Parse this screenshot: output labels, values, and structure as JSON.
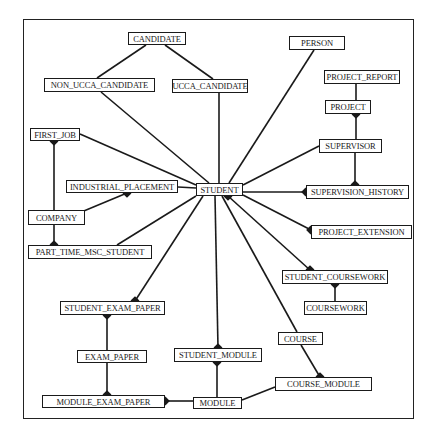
{
  "diagram": {
    "type": "entity-relationship",
    "entities": [
      {
        "id": "candidate",
        "label": "CANDIDATE",
        "x": 128,
        "y": 32,
        "w": 58,
        "h": 13
      },
      {
        "id": "non_ucca_candidate",
        "label": "NON_UCCA_CANDIDATE",
        "x": 44,
        "y": 78,
        "w": 111,
        "h": 14
      },
      {
        "id": "ucca_candidate",
        "label": "UCCA_CANDIDATE",
        "x": 172,
        "y": 79,
        "w": 76,
        "h": 14
      },
      {
        "id": "person",
        "label": "PERSON",
        "x": 289,
        "y": 36,
        "w": 56,
        "h": 14
      },
      {
        "id": "project_report",
        "label": "PROJECT_REPORT",
        "x": 324,
        "y": 70,
        "w": 76,
        "h": 14
      },
      {
        "id": "project",
        "label": "PROJECT",
        "x": 325,
        "y": 100,
        "w": 46,
        "h": 14
      },
      {
        "id": "supervisor",
        "label": "SUPERVISOR",
        "x": 319,
        "y": 139,
        "w": 63,
        "h": 14
      },
      {
        "id": "first_job",
        "label": "FIRST_JOB",
        "x": 30,
        "y": 128,
        "w": 50,
        "h": 13
      },
      {
        "id": "industrial_placement",
        "label": "INDUSTRIAL_PLACEMENT",
        "x": 66,
        "y": 180,
        "w": 112,
        "h": 13
      },
      {
        "id": "student",
        "label": "STUDENT",
        "x": 196,
        "y": 183,
        "w": 47,
        "h": 13
      },
      {
        "id": "supervision_history",
        "label": "SUPERVISION_HISTORY",
        "x": 306,
        "y": 185,
        "w": 103,
        "h": 14
      },
      {
        "id": "company",
        "label": "COMPANY",
        "x": 28,
        "y": 210,
        "w": 57,
        "h": 15
      },
      {
        "id": "project_extension",
        "label": "PROJECT_EXTENSION",
        "x": 311,
        "y": 225,
        "w": 101,
        "h": 14
      },
      {
        "id": "part_time_msc_student",
        "label": "PART_TIME_MSC_STUDENT",
        "x": 28,
        "y": 245,
        "w": 124,
        "h": 14
      },
      {
        "id": "student_coursework",
        "label": "STUDENT_COURSEWORK",
        "x": 282,
        "y": 270,
        "w": 106,
        "h": 14
      },
      {
        "id": "coursework",
        "label": "COURSEWORK",
        "x": 304,
        "y": 301,
        "w": 63,
        "h": 14
      },
      {
        "id": "student_exam_paper",
        "label": "STUDENT_EXAM_PAPER",
        "x": 60,
        "y": 301,
        "w": 105,
        "h": 14
      },
      {
        "id": "course",
        "label": "COURSE",
        "x": 278,
        "y": 332,
        "w": 45,
        "h": 13
      },
      {
        "id": "exam_paper",
        "label": "EXAM_PAPER",
        "x": 77,
        "y": 350,
        "w": 70,
        "h": 13
      },
      {
        "id": "student_module",
        "label": "STUDENT_MODULE",
        "x": 174,
        "y": 348,
        "w": 88,
        "h": 14
      },
      {
        "id": "course_module",
        "label": "COURSE_MODULE",
        "x": 275,
        "y": 377,
        "w": 97,
        "h": 14
      },
      {
        "id": "module_exam_paper",
        "label": "MODULE_EXAM_PAPER",
        "x": 42,
        "y": 395,
        "w": 123,
        "h": 13
      },
      {
        "id": "module",
        "label": "MODULE",
        "x": 193,
        "y": 397,
        "w": 49,
        "h": 12
      }
    ],
    "relationships": [
      {
        "from": "candidate",
        "to": "non_ucca_candidate",
        "x1": 146,
        "y1": 45,
        "x2": 97,
        "y2": 78
      },
      {
        "from": "candidate",
        "to": "ucca_candidate",
        "x1": 165,
        "y1": 45,
        "x2": 213,
        "y2": 79
      },
      {
        "from": "non_ucca_candidate",
        "to": "student",
        "x1": 101,
        "y1": 92,
        "x2": 209,
        "y2": 183
      },
      {
        "from": "ucca_candidate",
        "to": "student",
        "x1": 219,
        "y1": 93,
        "x2": 219,
        "y2": 183
      },
      {
        "from": "person",
        "to": "student",
        "x1": 314,
        "y1": 50,
        "x2": 229,
        "y2": 183
      },
      {
        "from": "project_report",
        "to": "project",
        "x1": 356,
        "y1": 84,
        "x2": 356,
        "y2": 100
      },
      {
        "from": "project",
        "to": "supervisor",
        "x1": 356,
        "y1": 114,
        "x2": 356,
        "y2": 139
      },
      {
        "from": "supervisor",
        "to": "student",
        "x1": 319,
        "y1": 146,
        "x2": 243,
        "y2": 185
      },
      {
        "from": "supervisor",
        "to": "supervision_history",
        "x1": 355,
        "y1": 153,
        "x2": 355,
        "y2": 185
      },
      {
        "from": "student",
        "to": "supervision_history",
        "x1": 243,
        "y1": 192,
        "x2": 306,
        "y2": 192
      },
      {
        "from": "student",
        "to": "project_extension",
        "x1": 243,
        "y1": 195,
        "x2": 311,
        "y2": 230
      },
      {
        "from": "first_job",
        "to": "student",
        "x1": 80,
        "y1": 134,
        "x2": 196,
        "y2": 185
      },
      {
        "from": "first_job",
        "to": "company",
        "x1": 54,
        "y1": 141,
        "x2": 54,
        "y2": 210
      },
      {
        "from": "industrial_placement",
        "to": "student",
        "x1": 178,
        "y1": 187,
        "x2": 196,
        "y2": 188
      },
      {
        "from": "company",
        "to": "industrial_placement",
        "x1": 79,
        "y1": 213,
        "x2": 127,
        "y2": 193
      },
      {
        "from": "company",
        "to": "part_time_msc_student",
        "x1": 54,
        "y1": 225,
        "x2": 54,
        "y2": 245
      },
      {
        "from": "part_time_msc_student",
        "to": "student",
        "x1": 117,
        "y1": 245,
        "x2": 196,
        "y2": 196
      },
      {
        "from": "student",
        "to": "student_exam_paper",
        "x1": 203,
        "y1": 196,
        "x2": 135,
        "y2": 301
      },
      {
        "from": "student",
        "to": "student_module",
        "x1": 215,
        "y1": 196,
        "x2": 218,
        "y2": 348
      },
      {
        "from": "student",
        "to": "course",
        "x1": 222,
        "y1": 196,
        "x2": 297,
        "y2": 332
      },
      {
        "from": "student",
        "to": "student_coursework",
        "x1": 228,
        "y1": 196,
        "x2": 310,
        "y2": 270
      },
      {
        "from": "student_coursework",
        "to": "coursework",
        "x1": 335,
        "y1": 284,
        "x2": 335,
        "y2": 301
      },
      {
        "from": "course",
        "to": "course_module",
        "x1": 301,
        "y1": 345,
        "x2": 320,
        "y2": 377
      },
      {
        "from": "student_exam_paper",
        "to": "exam_paper",
        "x1": 107,
        "y1": 315,
        "x2": 107,
        "y2": 350
      },
      {
        "from": "exam_paper",
        "to": "module_exam_paper",
        "x1": 107,
        "y1": 363,
        "x2": 107,
        "y2": 395
      },
      {
        "from": "student_module",
        "to": "module",
        "x1": 217,
        "y1": 362,
        "x2": 217,
        "y2": 397
      },
      {
        "from": "module_exam_paper",
        "to": "module",
        "x1": 165,
        "y1": 401,
        "x2": 193,
        "y2": 401
      },
      {
        "from": "module",
        "to": "course_module",
        "x1": 242,
        "y1": 400,
        "x2": 275,
        "y2": 387
      }
    ],
    "crows_feet": [
      {
        "x": 54,
        "y": 141,
        "dir": "up"
      },
      {
        "x": 127,
        "y": 193,
        "dir": "up"
      },
      {
        "x": 54,
        "y": 245,
        "dir": "down"
      },
      {
        "x": 135,
        "y": 301,
        "dir": "down"
      },
      {
        "x": 107,
        "y": 315,
        "dir": "up"
      },
      {
        "x": 107,
        "y": 395,
        "dir": "down"
      },
      {
        "x": 356,
        "y": 114,
        "dir": "up"
      },
      {
        "x": 355,
        "y": 185,
        "dir": "down"
      },
      {
        "x": 306,
        "y": 192,
        "dir": "right"
      },
      {
        "x": 311,
        "y": 230,
        "dir": "right"
      },
      {
        "x": 310,
        "y": 270,
        "dir": "down"
      },
      {
        "x": 335,
        "y": 284,
        "dir": "up"
      },
      {
        "x": 218,
        "y": 348,
        "dir": "down"
      },
      {
        "x": 217,
        "y": 362,
        "dir": "up"
      },
      {
        "x": 320,
        "y": 377,
        "dir": "down"
      },
      {
        "x": 165,
        "y": 401,
        "dir": "left"
      },
      {
        "x": 228,
        "y": 196,
        "dir": "up"
      }
    ]
  }
}
